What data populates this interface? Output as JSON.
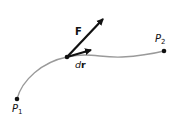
{
  "diagram": {
    "labels": {
      "force": "F",
      "displacement_d": "d",
      "displacement_r": "r",
      "start_point_letter": "P",
      "start_point_sub": "1",
      "end_point_letter": "P",
      "end_point_sub": "2"
    },
    "colors": {
      "curve": "#9a9a9a",
      "arrows": "#111111",
      "points": "#111111"
    },
    "points": {
      "P1": [
        17,
        99
      ],
      "mid": [
        67,
        57
      ],
      "P2": [
        164,
        51
      ]
    }
  }
}
